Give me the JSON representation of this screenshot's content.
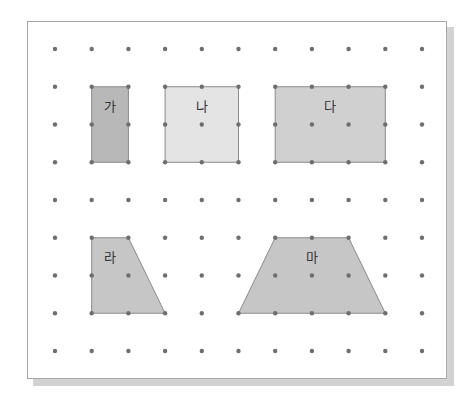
{
  "grid": {
    "columns": 11,
    "rows": 9,
    "origin_x": 55,
    "origin_y": 49,
    "spacing_x": 36.7,
    "spacing_y": 37.75,
    "dot_color": "#6e6e6e",
    "dot_radius": 2.2
  },
  "shapes": [
    {
      "label": "가",
      "type": "rectangle",
      "points": [
        [
          1,
          1
        ],
        [
          2,
          1
        ],
        [
          2,
          3
        ],
        [
          1,
          3
        ]
      ],
      "fill": "#b8b8b8",
      "label_at": [
        1.5,
        1.55
      ]
    },
    {
      "label": "나",
      "type": "square",
      "points": [
        [
          3,
          1
        ],
        [
          5,
          1
        ],
        [
          5,
          3
        ],
        [
          3,
          3
        ]
      ],
      "fill": "#e4e4e4",
      "label_at": [
        4,
        1.55
      ]
    },
    {
      "label": "다",
      "type": "rectangle",
      "points": [
        [
          6,
          1
        ],
        [
          9,
          1
        ],
        [
          9,
          3
        ],
        [
          6,
          3
        ]
      ],
      "fill": "#d0d0d0",
      "label_at": [
        7.5,
        1.55
      ]
    },
    {
      "label": "라",
      "type": "trapezoid",
      "points": [
        [
          1,
          5
        ],
        [
          2,
          5
        ],
        [
          3,
          7
        ],
        [
          1,
          7
        ]
      ],
      "fill": "#c6c6c6",
      "label_at": [
        1.5,
        5.55
      ]
    },
    {
      "label": "마",
      "type": "trapezoid",
      "points": [
        [
          6,
          5
        ],
        [
          8,
          5
        ],
        [
          9,
          7
        ],
        [
          5,
          7
        ]
      ],
      "fill": "#c6c6c6",
      "label_at": [
        7,
        5.55
      ]
    }
  ],
  "stroke_color": "#8a8a8a"
}
